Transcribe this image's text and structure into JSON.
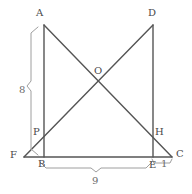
{
  "figure": {
    "type": "geometry-diagram",
    "width": 192,
    "height": 194,
    "background_color": "#ffffff",
    "stroke_color": "#555555",
    "brace_color": "#9a9a9a",
    "label_color": "#4a4a4a"
  },
  "points": {
    "A": {
      "label": "A",
      "x": 44,
      "y": 25,
      "label_x": 36,
      "label_y": 8
    },
    "D": {
      "label": "D",
      "x": 153,
      "y": 25,
      "label_x": 148,
      "label_y": 8
    },
    "O": {
      "label": "O",
      "x": 98,
      "y": 82,
      "label_x": 94,
      "label_y": 66
    },
    "P": {
      "label": "P",
      "x": 44,
      "y": 135,
      "label_x": 33,
      "label_y": 127
    },
    "H": {
      "label": "H",
      "x": 153,
      "y": 135,
      "label_x": 155,
      "label_y": 127
    },
    "F": {
      "label": "F",
      "x": 24,
      "y": 157,
      "label_x": 10,
      "label_y": 150
    },
    "B": {
      "label": "B",
      "x": 44,
      "y": 157,
      "label_x": 38,
      "label_y": 159
    },
    "E": {
      "label": "E",
      "x": 153,
      "y": 157,
      "label_x": 149,
      "label_y": 160
    },
    "C": {
      "label": "C",
      "x": 172,
      "y": 157,
      "label_x": 176,
      "label_y": 149
    }
  },
  "segments": [
    {
      "name": "segment-AB",
      "from": "A",
      "to": "B",
      "x1": 44,
      "y1": 25,
      "x2": 44,
      "y2": 157
    },
    {
      "name": "segment-DE",
      "from": "D",
      "to": "E",
      "x1": 153,
      "y1": 25,
      "x2": 153,
      "y2": 157
    },
    {
      "name": "segment-FC",
      "from": "F",
      "to": "C",
      "x1": 24,
      "y1": 157,
      "x2": 172,
      "y2": 157
    },
    {
      "name": "segment-AC",
      "from": "A",
      "to": "C",
      "x1": 44,
      "y1": 25,
      "x2": 172,
      "y2": 157
    },
    {
      "name": "segment-DF",
      "from": "D",
      "to": "F",
      "x1": 153,
      "y1": 25,
      "x2": 24,
      "y2": 157
    }
  ],
  "measurements": {
    "vertical": {
      "name": "measure-8",
      "value": "8",
      "label_x": 19,
      "label_y": 85,
      "brace_x": 31,
      "brace_top": 27,
      "brace_bottom": 155,
      "describes": "AB"
    },
    "horizontal": {
      "name": "measure-9",
      "value": "9",
      "label_x": 92,
      "label_y": 176,
      "brace_y": 168,
      "brace_left": 40,
      "brace_right": 152,
      "describes": "BE"
    },
    "short": {
      "name": "measure-1",
      "value": "1",
      "label_x": 161,
      "label_y": 159,
      "brace_y": 164,
      "brace_left": 153,
      "brace_right": 172,
      "describes": "EC"
    }
  }
}
